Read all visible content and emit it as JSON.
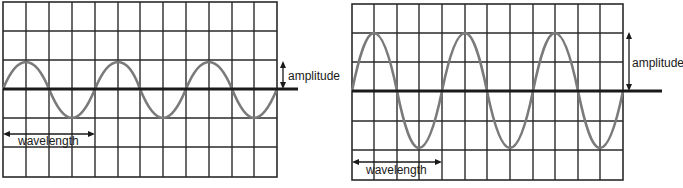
{
  "figure": {
    "panels": [
      {
        "id": "small-amplitude",
        "amplitude_label": "amplitude",
        "wavelength_label": "wavelength",
        "grid": {
          "columns": 12,
          "rows": 6
        },
        "wave": {
          "cycles": 3,
          "amplitude_grid_units": 1,
          "wavelength_grid_units": 4
        }
      },
      {
        "id": "large-amplitude",
        "amplitude_label": "amplitude",
        "wavelength_label": "wavelength",
        "grid": {
          "columns": 12,
          "rows": 6
        },
        "wave": {
          "cycles": 3,
          "amplitude_grid_units": 2,
          "wavelength_grid_units": 4
        }
      }
    ],
    "colors": {
      "grid": "#2a2a2a",
      "wave": "#7a7a7a",
      "axis": "#1a1a1a",
      "background": "#ffffff"
    }
  }
}
